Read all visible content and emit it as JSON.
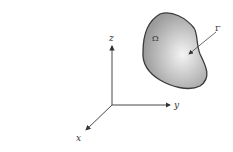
{
  "figure": {
    "domain_label": "Ω",
    "boundary_label": "Γ",
    "axes": {
      "x_label": "x",
      "y_label": "y",
      "z_label": "z"
    },
    "colors": {
      "domain_fill_edge": "#9a9a9a",
      "domain_fill_center": "#f2f2f2",
      "outline": "#3a3a3a",
      "axis": "#333333"
    }
  }
}
